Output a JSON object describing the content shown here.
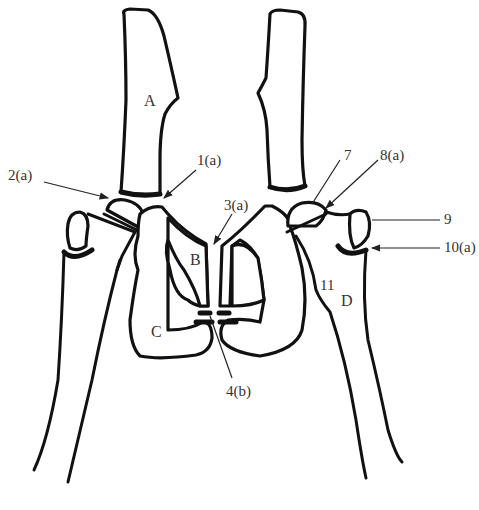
{
  "diagram": {
    "type": "anatomical-line-drawing",
    "region_letters": {
      "A": "A",
      "B": "B",
      "C": "C",
      "D": "D"
    },
    "callouts": [
      {
        "id": "1a",
        "text": "1(a)"
      },
      {
        "id": "2a",
        "text": "2(a)"
      },
      {
        "id": "3a",
        "text": "3(a)"
      },
      {
        "id": "4b",
        "text": "4(b)"
      },
      {
        "id": "7",
        "text": "7"
      },
      {
        "id": "8a",
        "text": "8(a)"
      },
      {
        "id": "9",
        "text": "9"
      },
      {
        "id": "10a",
        "text": "10(a)"
      },
      {
        "id": "11",
        "text": "11"
      }
    ],
    "colors": {
      "stroke": "#111111",
      "label": "#333333",
      "background": "#ffffff"
    }
  }
}
